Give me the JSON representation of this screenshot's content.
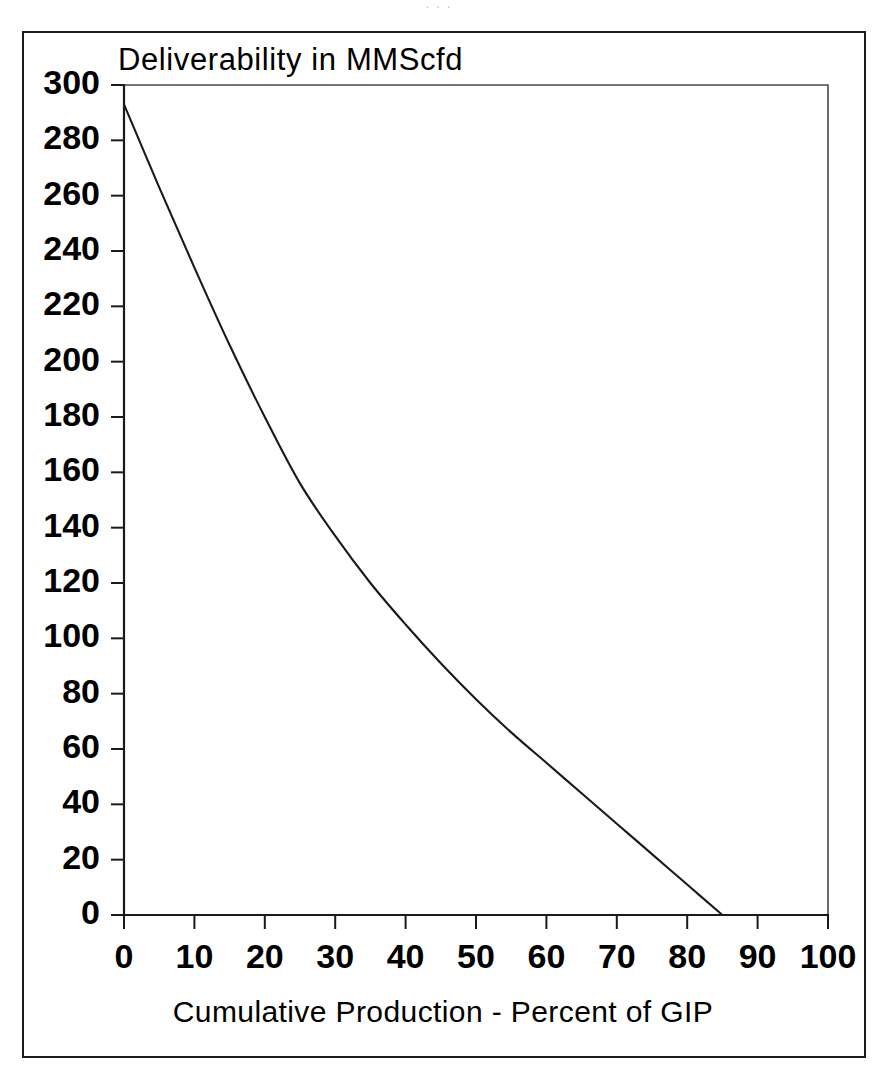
{
  "figure": {
    "top_bleed_text": ". . .",
    "frame": {
      "color": "#1c1c1c"
    }
  },
  "chart_data": {
    "type": "line",
    "title": "Deliverability in MMScfd",
    "xlabel": "Cumulative Production - Percent of GIP",
    "ylabel": "Deliverability in MMScfd",
    "xlim": [
      0,
      100
    ],
    "ylim": [
      0,
      300
    ],
    "grid": false,
    "legend": null,
    "line_color": "#1a1a1a",
    "x_ticks": [
      0,
      10,
      20,
      30,
      40,
      50,
      60,
      70,
      80,
      90,
      100
    ],
    "x_tick_labels": [
      "0",
      "10",
      "20",
      "30",
      "40",
      "50",
      "60",
      "70",
      "80",
      "90",
      "100"
    ],
    "y_ticks": [
      0,
      20,
      40,
      60,
      80,
      100,
      120,
      140,
      160,
      180,
      200,
      220,
      240,
      260,
      280,
      300
    ],
    "y_tick_labels": [
      "0",
      "20",
      "40",
      "60",
      "80",
      "100",
      "120",
      "140",
      "160",
      "180",
      "200",
      "220",
      "240",
      "260",
      "280",
      "300"
    ],
    "series": [
      {
        "name": "Deliverability",
        "x": [
          0,
          5,
          10,
          15,
          20,
          25,
          30,
          35,
          40,
          45,
          50,
          55,
          60,
          65,
          70,
          75,
          80,
          85
        ],
        "values": [
          293,
          263,
          234,
          206,
          180,
          156,
          137,
          120,
          105,
          91,
          78,
          66,
          55,
          44,
          33,
          22,
          11,
          0
        ]
      }
    ],
    "annotations": []
  }
}
